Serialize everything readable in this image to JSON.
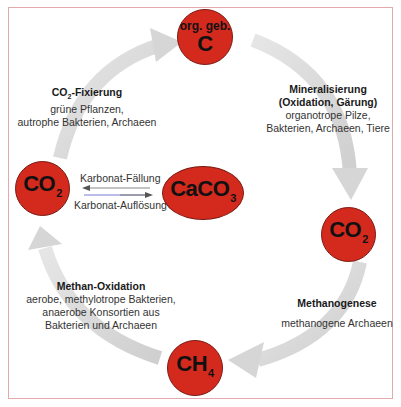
{
  "colors": {
    "node_fill": "#d42a1e",
    "arrow_gray": "#d4d4d4",
    "frame": "#e3a9ad",
    "arrow_blue": "#7a7ad8"
  },
  "nodes": {
    "top": {
      "small": "org. geb.",
      "main": "C"
    },
    "right": {
      "main": "CO",
      "sub": "2"
    },
    "bottom": {
      "main": "CH",
      "sub": "4"
    },
    "left": {
      "main": "CO",
      "sub": "2"
    },
    "center": {
      "main": "CaCO",
      "sub": "3"
    }
  },
  "labels": {
    "fixation": {
      "title_main": "CO",
      "title_sub": "2",
      "title_rest": "-Fixierung",
      "lines": [
        "grüne Pflanzen,",
        "autrophe Bakterien, Archaeen"
      ]
    },
    "mineralization": {
      "title_lines": [
        "Mineralisierung",
        "(Oxidation, Gärung)"
      ],
      "lines": [
        "organotrope Pilze,",
        "Bakterien, Archaeen, Tiere"
      ]
    },
    "methanogenesis": {
      "title": "Methanogenese",
      "lines": [
        "methanogene Archaeen"
      ]
    },
    "methane_oxidation": {
      "title": "Methan-Oxidation",
      "lines": [
        "aerobe, methylotrope Bakterien,",
        "anaerobe Konsortien aus",
        "Bakterien und Archaeen"
      ]
    },
    "carbonate": {
      "precipitation": "Karbonat-Fällung",
      "dissolution": "Karbonat-Auflösung"
    }
  }
}
